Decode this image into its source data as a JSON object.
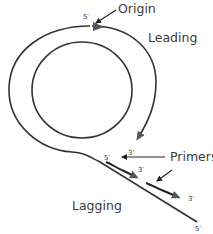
{
  "diagram": {
    "type": "rolling-circle DNA replication",
    "labels": {
      "origin": "Origin",
      "leading": "Leading",
      "primers": "Primers",
      "lagging": "Lagging"
    },
    "ends": {
      "origin_5": "5′",
      "primer1_5": "5′",
      "primer1_3a": "3′",
      "primer1_3b": "3′",
      "primer2_3": "3′",
      "tail_5": "5′"
    },
    "colors": {
      "stroke": "#333333",
      "arrowhead": "#555555",
      "text": "#3a3a3a",
      "background": "#ffffff"
    }
  }
}
